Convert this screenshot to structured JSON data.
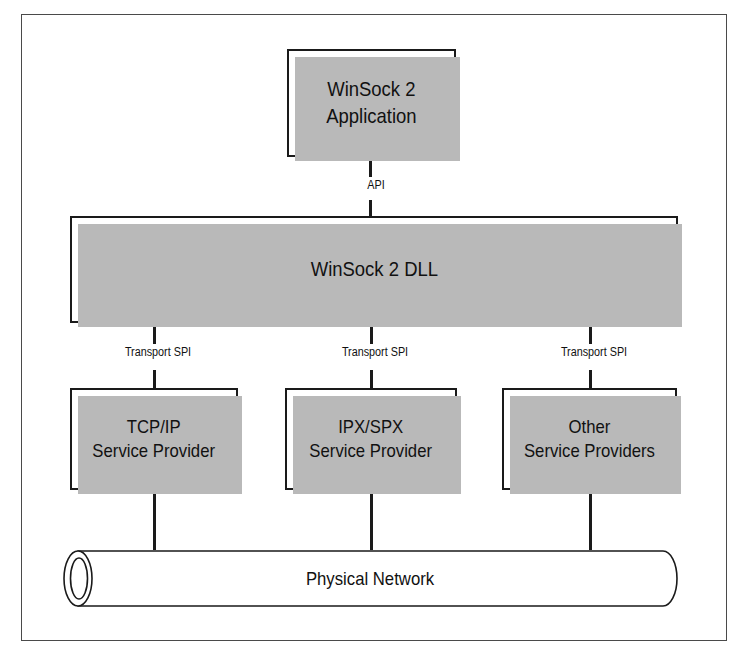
{
  "diagram": {
    "frame": {
      "border_color": "#4a4a4a"
    },
    "colors": {
      "line": "#1a1a1a",
      "shadow": "#b9b9b9",
      "background": "#ffffff",
      "text": "#111111"
    },
    "nodes": {
      "application": {
        "label": "WinSock 2\nApplication"
      },
      "dll": {
        "label": "WinSock 2 DLL"
      },
      "service_providers": [
        {
          "label": "TCP/IP\nService Provider"
        },
        {
          "label": "IPX/SPX\nService Provider"
        },
        {
          "label": "Other\nService Providers"
        }
      ],
      "network": {
        "label": "Physical Network",
        "shape": "cylinder"
      }
    },
    "edge_labels": {
      "api": "API",
      "transport_spi": [
        "Transport SPI",
        "Transport SPI",
        "Transport SPI"
      ]
    }
  }
}
